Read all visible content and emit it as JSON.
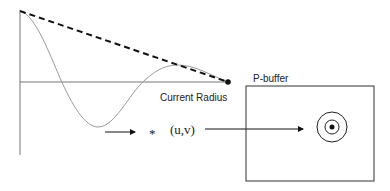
{
  "labels": {
    "current_radius": "Current Radius",
    "pbuffer": "P-buffer",
    "asterisk": "*",
    "uv": "(u,v)"
  },
  "colors": {
    "stroke": "#111111",
    "curve": "#9a9a9a",
    "axis": "#777777",
    "text": "#222222"
  }
}
